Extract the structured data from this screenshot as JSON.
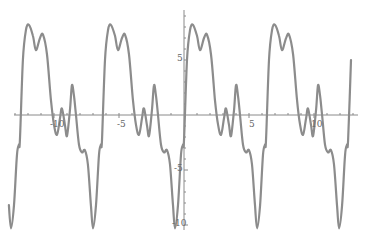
{
  "chart_data": {
    "type": "line",
    "title": "",
    "xlabel": "",
    "ylabel": "",
    "xlim": [
      -13.5,
      13.0
    ],
    "ylim": [
      -10.5,
      8.5
    ],
    "grid": false,
    "legend": null,
    "x_ticks": [
      {
        "value": -10,
        "label": "-10"
      },
      {
        "value": -5,
        "label": "-5"
      },
      {
        "value": 5,
        "label": "5"
      },
      {
        "value": 10,
        "label": "10"
      }
    ],
    "y_ticks": [
      {
        "value": 5,
        "label": "5"
      },
      {
        "value": -5,
        "label": "-5"
      },
      {
        "value": -10,
        "label": "-10"
      }
    ],
    "period_approx": 6.28,
    "series": [
      {
        "name": "f(x)",
        "color": "#8c8c8c",
        "description": "periodic curve with double-peaked maximum ~8, two small oscillations near 0, and deep minimum ~-10 each period",
        "one_period_points": [
          [
            0.0,
            -2.3
          ],
          [
            0.23,
            5.0
          ],
          [
            0.46,
            7.7
          ],
          [
            0.69,
            8.2
          ],
          [
            1.0,
            7.2
          ],
          [
            1.23,
            5.9
          ],
          [
            1.54,
            7.0
          ],
          [
            1.77,
            7.3
          ],
          [
            2.08,
            5.5
          ],
          [
            2.38,
            1.4
          ],
          [
            2.62,
            -0.9
          ],
          [
            2.85,
            -1.8
          ],
          [
            3.08,
            -0.3
          ],
          [
            3.23,
            0.6
          ],
          [
            3.46,
            -0.9
          ],
          [
            3.62,
            -1.9
          ],
          [
            3.85,
            0.5
          ],
          [
            4.0,
            2.7
          ],
          [
            4.15,
            1.8
          ],
          [
            4.31,
            0.0
          ],
          [
            4.54,
            -2.7
          ],
          [
            4.77,
            -3.4
          ],
          [
            5.0,
            -3.2
          ],
          [
            5.23,
            -4.5
          ],
          [
            5.46,
            -8.2
          ],
          [
            5.62,
            -10.3
          ],
          [
            5.85,
            -8.2
          ],
          [
            6.08,
            -3.6
          ],
          [
            6.23,
            -2.7
          ],
          [
            6.31,
            -2.3
          ]
        ]
      }
    ]
  }
}
